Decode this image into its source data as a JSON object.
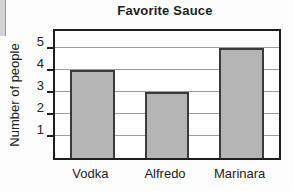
{
  "title": "Favorite Sauce",
  "chart_data": {
    "type": "bar",
    "title": "Favorite Sauce",
    "xlabel": "",
    "ylabel": "Number of people",
    "categories": [
      "Vodka",
      "Alfredo",
      "Marinara"
    ],
    "values": [
      4,
      3,
      5
    ],
    "yticks": [
      1,
      2,
      3,
      4,
      5
    ],
    "ylim": [
      0,
      5.77
    ],
    "grid": true,
    "legend_position": "none",
    "bar_color": "#b5b5b5",
    "bar_border_color": "#3a3a3a",
    "gridline_color": "#9c9c9c",
    "plot_border_color": "#1f1f1f",
    "text_color": "#222222"
  }
}
